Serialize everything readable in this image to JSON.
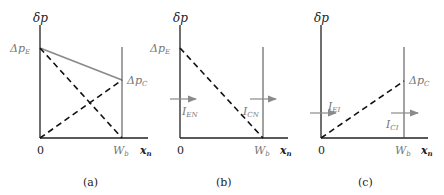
{
  "panels": [
    {
      "id": "a",
      "caption": "(a)",
      "y_axis_label": "δp",
      "x_axis_label": "x",
      "x_axis_sub": "n",
      "origin_label": "0",
      "wb_label": "W",
      "wb_sub": "b",
      "left_value_label": "Δp",
      "left_value_sub": "E",
      "right_value_label": "Δp",
      "right_value_sub": "C"
    },
    {
      "id": "b",
      "caption": "(b)",
      "y_axis_label": "δp",
      "x_axis_label": "x",
      "x_axis_sub": "n",
      "origin_label": "0",
      "wb_label": "W",
      "wb_sub": "b",
      "left_value_label": "Δp",
      "left_value_sub": "E",
      "current_left": "I",
      "current_left_sub": "EN",
      "current_right": "I",
      "current_right_sub": "CN"
    },
    {
      "id": "c",
      "caption": "(c)",
      "y_axis_label": "δp",
      "x_axis_label": "x",
      "x_axis_sub": "n",
      "origin_label": "0",
      "wb_label": "W",
      "wb_sub": "b",
      "right_value_label": "Δp",
      "right_value_sub": "C",
      "current_left": "I",
      "current_left_sub": "EI",
      "current_right": "I",
      "current_right_sub": "CI"
    }
  ],
  "colors": {
    "axis": "#222222",
    "dashed": "#111111",
    "solid_line": "#8a8a8a",
    "arrow": "#8a8a8a"
  }
}
